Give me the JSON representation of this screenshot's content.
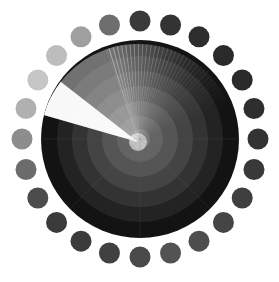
{
  "graphic": {
    "name": "radar-sweep-icon",
    "type": "radar-display",
    "canvas": {
      "width": 279,
      "height": 282,
      "background": "#ffffff"
    },
    "disk": {
      "center_x": 140,
      "center_y": 139,
      "radius": 99,
      "outer_ring_color": "#111111",
      "outer_ring_width": 16
    },
    "rings": [
      {
        "index": 0,
        "radius": 99,
        "color": "#131313",
        "label": "outer-rim"
      },
      {
        "index": 1,
        "radius": 83,
        "color": "#232323",
        "label": "ring-5"
      },
      {
        "index": 2,
        "radius": 68,
        "color": "#333333",
        "label": "ring-4"
      },
      {
        "index": 3,
        "radius": 53,
        "color": "#444444",
        "label": "ring-3"
      },
      {
        "index": 4,
        "radius": 38,
        "color": "#555555",
        "label": "ring-2"
      },
      {
        "index": 5,
        "radius": 23,
        "color": "#646464",
        "label": "ring-1"
      },
      {
        "index": 6,
        "radius": 10,
        "color": "#787878",
        "label": "ring-0"
      }
    ],
    "sweep": {
      "apex_x": 138,
      "apex_y": 142,
      "leading_angle_deg": 196,
      "trailing_angle_deg": 250,
      "tail_angle_deg": 100,
      "head_color": "#ffffff",
      "tail_color": "#9a9a9a",
      "length": 98,
      "label": "radar-sweep-beam"
    },
    "crosshair": {
      "visible": true,
      "color": "#6a6a6a",
      "opacity": 0.18,
      "angles_deg": [
        0,
        45,
        90,
        135,
        180,
        225,
        270,
        315
      ]
    },
    "dots": {
      "count": 24,
      "orbit_radius": 118,
      "dot_radius": 10.5,
      "start_angle_deg": -90,
      "colors": [
        "#3a3a3a",
        "#333333",
        "#2d2d2d",
        "#2a2a2a",
        "#2a2a2a",
        "#2e2e2e",
        "#333333",
        "#393939",
        "#3f3f3f",
        "#454545",
        "#4d4d4d",
        "#535353",
        "#4a4a4a",
        "#414141",
        "#3b3b3b",
        "#3b3b3b",
        "#4c4c4c",
        "#6c6c6c",
        "#8d8d8d",
        "#b0b0b0",
        "#c6c6c6",
        "#bdbdbd",
        "#9f9f9f",
        "#6e6e6e"
      ]
    }
  }
}
